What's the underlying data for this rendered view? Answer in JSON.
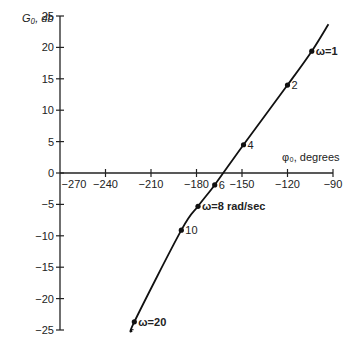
{
  "chart_data": {
    "type": "line",
    "title": "",
    "xlabel": "φ₀, degrees",
    "ylabel": "G₀, db",
    "xlim": [
      -270,
      -90
    ],
    "ylim": [
      -25,
      25
    ],
    "x_ticks": [
      -270,
      -240,
      -210,
      -180,
      -150,
      -120,
      -90
    ],
    "y_ticks": [
      25,
      20,
      15,
      10,
      5,
      0,
      -5,
      -10,
      -15,
      -20,
      -25
    ],
    "grid": false,
    "legend": null,
    "series": [
      {
        "name": "Nichols plot",
        "points": [
          {
            "omega_label": "ω = 1",
            "phase_deg": -104,
            "gain_db": 19.4
          },
          {
            "omega_label": "2",
            "phase_deg": -120,
            "gain_db": 14.0
          },
          {
            "omega_label": "4",
            "phase_deg": -149,
            "gain_db": 4.5
          },
          {
            "omega_label": "6",
            "phase_deg": -168,
            "gain_db": -1.9
          },
          {
            "omega_label": "ω = 8 rad/sec",
            "phase_deg": -179,
            "gain_db": -5.3
          },
          {
            "omega_label": "10",
            "phase_deg": -190,
            "gain_db": -9.1
          },
          {
            "omega_label": "ω = 20",
            "phase_deg": -221,
            "gain_db": -23.7
          }
        ],
        "curve_extent": {
          "start": {
            "phase_deg": -93,
            "gain_db": 23.7
          },
          "end": {
            "phase_deg": -222,
            "gain_db": -25
          }
        }
      }
    ]
  },
  "labels": {
    "y_axis_title": "G₀, db",
    "x_axis_title": "φ₀, degrees"
  }
}
